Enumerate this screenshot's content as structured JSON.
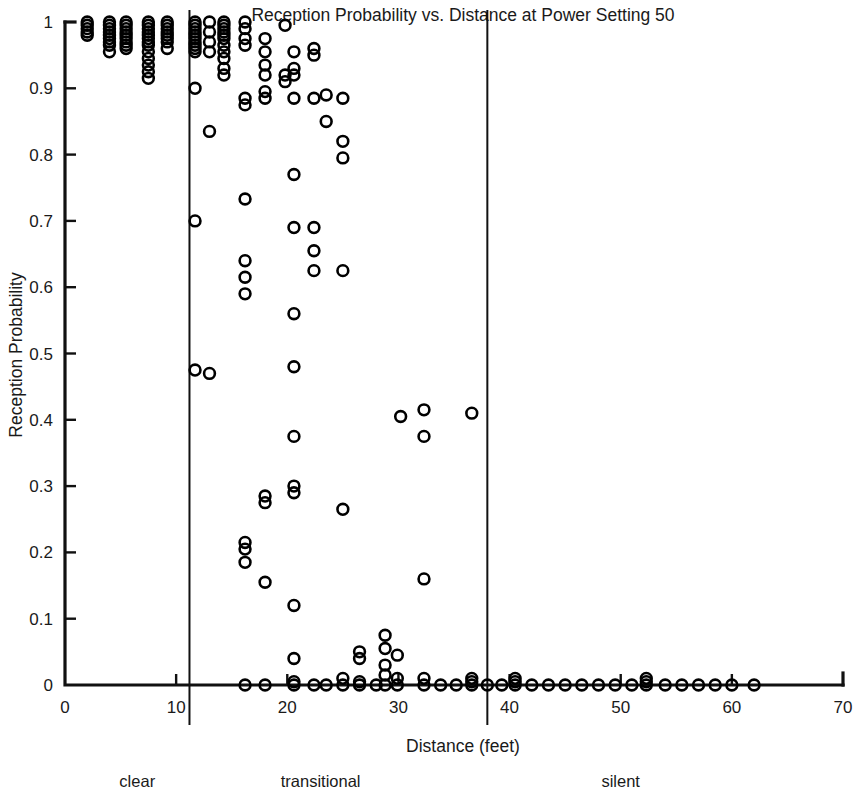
{
  "chart_data": {
    "type": "scatter",
    "title": "Reception Probability vs. Distance at Power Setting 50",
    "xlabel": "Distance (feet)",
    "ylabel": "Reception Probability",
    "xlim": [
      0,
      70
    ],
    "ylim": [
      0,
      1
    ],
    "xticks": [
      0,
      10,
      20,
      30,
      40,
      50,
      60,
      70
    ],
    "xtick_labels": [
      "0",
      "10",
      "20",
      "30",
      "40",
      "50",
      "60",
      "70"
    ],
    "yticks": [
      0,
      0.1,
      0.2,
      0.3,
      0.4,
      0.5,
      0.6,
      0.7,
      0.8,
      0.9,
      1
    ],
    "ytick_labels": [
      "0",
      "0.1",
      "0.2",
      "0.3",
      "0.4",
      "0.5",
      "0.6",
      "0.7",
      "0.8",
      "0.9",
      "1"
    ],
    "grid": false,
    "legend": "none",
    "marker": "open-circle",
    "marker_color": "#000000",
    "marker_radius_px": 5.4,
    "regions": [
      {
        "name": "clear",
        "label": "clear",
        "x_start": 0,
        "x_end": 11.2,
        "label_x": 6.5
      },
      {
        "name": "transitional",
        "label": "transitional",
        "x_start": 11.2,
        "x_end": 38.0,
        "label_x": 23.0
      },
      {
        "name": "silent",
        "label": "silent",
        "x_start": 38.0,
        "x_end": 70,
        "label_x": 50.0
      }
    ],
    "region_dividers": [
      11.2,
      38.0
    ],
    "points": [
      [
        2.0,
        1.0
      ],
      [
        2.0,
        0.995
      ],
      [
        2.0,
        0.99
      ],
      [
        2.0,
        0.985
      ],
      [
        2.0,
        0.98
      ],
      [
        4.0,
        1.0
      ],
      [
        4.0,
        0.995
      ],
      [
        4.0,
        0.99
      ],
      [
        4.0,
        0.985
      ],
      [
        4.0,
        0.98
      ],
      [
        4.0,
        0.975
      ],
      [
        4.0,
        0.97
      ],
      [
        4.0,
        0.965
      ],
      [
        4.0,
        0.955
      ],
      [
        5.5,
        1.0
      ],
      [
        5.5,
        0.995
      ],
      [
        5.5,
        0.99
      ],
      [
        5.5,
        0.985
      ],
      [
        5.5,
        0.98
      ],
      [
        5.5,
        0.975
      ],
      [
        5.5,
        0.97
      ],
      [
        5.5,
        0.965
      ],
      [
        5.5,
        0.96
      ],
      [
        7.5,
        1.0
      ],
      [
        7.5,
        0.995
      ],
      [
        7.5,
        0.99
      ],
      [
        7.5,
        0.985
      ],
      [
        7.5,
        0.98
      ],
      [
        7.5,
        0.975
      ],
      [
        7.5,
        0.97
      ],
      [
        7.5,
        0.965
      ],
      [
        7.5,
        0.955
      ],
      [
        7.5,
        0.945
      ],
      [
        7.5,
        0.935
      ],
      [
        7.5,
        0.925
      ],
      [
        7.5,
        0.915
      ],
      [
        9.2,
        1.0
      ],
      [
        9.2,
        0.995
      ],
      [
        9.2,
        0.99
      ],
      [
        9.2,
        0.985
      ],
      [
        9.2,
        0.98
      ],
      [
        9.2,
        0.975
      ],
      [
        9.2,
        0.97
      ],
      [
        9.2,
        0.96
      ],
      [
        11.7,
        1.0
      ],
      [
        11.7,
        0.995
      ],
      [
        11.7,
        0.99
      ],
      [
        11.7,
        0.985
      ],
      [
        11.7,
        0.98
      ],
      [
        11.7,
        0.975
      ],
      [
        11.7,
        0.97
      ],
      [
        11.7,
        0.965
      ],
      [
        11.7,
        0.96
      ],
      [
        11.7,
        0.955
      ],
      [
        11.7,
        0.9
      ],
      [
        11.7,
        0.7
      ],
      [
        11.7,
        0.475
      ],
      [
        13.0,
        1.0
      ],
      [
        13.0,
        0.985
      ],
      [
        13.0,
        0.97
      ],
      [
        13.0,
        0.955
      ],
      [
        13.0,
        0.835
      ],
      [
        13.0,
        0.47
      ],
      [
        14.3,
        1.0
      ],
      [
        14.3,
        0.995
      ],
      [
        14.3,
        0.99
      ],
      [
        14.3,
        0.985
      ],
      [
        14.3,
        0.98
      ],
      [
        14.3,
        0.975
      ],
      [
        14.3,
        0.965
      ],
      [
        14.3,
        0.955
      ],
      [
        14.3,
        0.945
      ],
      [
        14.3,
        0.93
      ],
      [
        14.3,
        0.92
      ],
      [
        16.2,
        1.0
      ],
      [
        16.2,
        0.99
      ],
      [
        16.2,
        0.975
      ],
      [
        16.2,
        0.965
      ],
      [
        16.2,
        0.885
      ],
      [
        16.2,
        0.875
      ],
      [
        16.2,
        0.733
      ],
      [
        16.2,
        0.64
      ],
      [
        16.2,
        0.615
      ],
      [
        16.2,
        0.59
      ],
      [
        16.2,
        0.215
      ],
      [
        16.2,
        0.205
      ],
      [
        16.2,
        0.185
      ],
      [
        16.2,
        0.0
      ],
      [
        18.0,
        0.975
      ],
      [
        18.0,
        0.955
      ],
      [
        18.0,
        0.935
      ],
      [
        18.0,
        0.92
      ],
      [
        18.0,
        0.895
      ],
      [
        18.0,
        0.885
      ],
      [
        18.0,
        0.285
      ],
      [
        18.0,
        0.275
      ],
      [
        18.0,
        0.155
      ],
      [
        18.0,
        0.0
      ],
      [
        19.8,
        0.995
      ],
      [
        19.8,
        0.92
      ],
      [
        19.8,
        0.91
      ],
      [
        20.6,
        0.955
      ],
      [
        20.6,
        0.93
      ],
      [
        20.6,
        0.92
      ],
      [
        20.6,
        0.885
      ],
      [
        20.6,
        0.77
      ],
      [
        20.6,
        0.69
      ],
      [
        20.6,
        0.56
      ],
      [
        20.6,
        0.48
      ],
      [
        20.6,
        0.375
      ],
      [
        20.6,
        0.3
      ],
      [
        20.6,
        0.29
      ],
      [
        20.6,
        0.12
      ],
      [
        20.6,
        0.04
      ],
      [
        20.6,
        0.005
      ],
      [
        20.6,
        0.0
      ],
      [
        22.4,
        0.96
      ],
      [
        22.4,
        0.95
      ],
      [
        22.4,
        0.885
      ],
      [
        22.4,
        0.69
      ],
      [
        22.4,
        0.655
      ],
      [
        22.4,
        0.625
      ],
      [
        22.4,
        0.0
      ],
      [
        23.5,
        0.89
      ],
      [
        23.5,
        0.85
      ],
      [
        23.5,
        0.0
      ],
      [
        25.0,
        0.885
      ],
      [
        25.0,
        0.82
      ],
      [
        25.0,
        0.795
      ],
      [
        25.0,
        0.625
      ],
      [
        25.0,
        0.265
      ],
      [
        25.0,
        0.01
      ],
      [
        25.0,
        0.0
      ],
      [
        26.5,
        0.05
      ],
      [
        26.5,
        0.04
      ],
      [
        26.5,
        0.005
      ],
      [
        26.5,
        0.0
      ],
      [
        28.0,
        0.0
      ],
      [
        28.8,
        0.075
      ],
      [
        28.8,
        0.055
      ],
      [
        28.8,
        0.03
      ],
      [
        28.8,
        0.015
      ],
      [
        28.8,
        0.0
      ],
      [
        29.9,
        0.045
      ],
      [
        29.9,
        0.01
      ],
      [
        29.9,
        0.0
      ],
      [
        30.2,
        0.405
      ],
      [
        32.3,
        0.415
      ],
      [
        32.3,
        0.375
      ],
      [
        32.3,
        0.16
      ],
      [
        32.3,
        0.01
      ],
      [
        32.3,
        0.0
      ],
      [
        33.8,
        0.0
      ],
      [
        35.2,
        0.0
      ],
      [
        36.6,
        0.41
      ],
      [
        36.6,
        0.01
      ],
      [
        36.6,
        0.005
      ],
      [
        36.6,
        0.0
      ],
      [
        38.0,
        0.0
      ],
      [
        39.3,
        0.0
      ],
      [
        40.5,
        0.01
      ],
      [
        40.5,
        0.005
      ],
      [
        40.5,
        0.0
      ],
      [
        42.0,
        0.0
      ],
      [
        43.5,
        0.0
      ],
      [
        45.0,
        0.0
      ],
      [
        46.5,
        0.0
      ],
      [
        48.0,
        0.0
      ],
      [
        49.5,
        0.0
      ],
      [
        51.0,
        0.0
      ],
      [
        52.3,
        0.01
      ],
      [
        52.3,
        0.005
      ],
      [
        52.3,
        0.0
      ],
      [
        54.0,
        0.0
      ],
      [
        55.5,
        0.0
      ],
      [
        57.0,
        0.0
      ],
      [
        58.5,
        0.0
      ],
      [
        60.0,
        0.0
      ],
      [
        62.0,
        0.0
      ]
    ]
  }
}
